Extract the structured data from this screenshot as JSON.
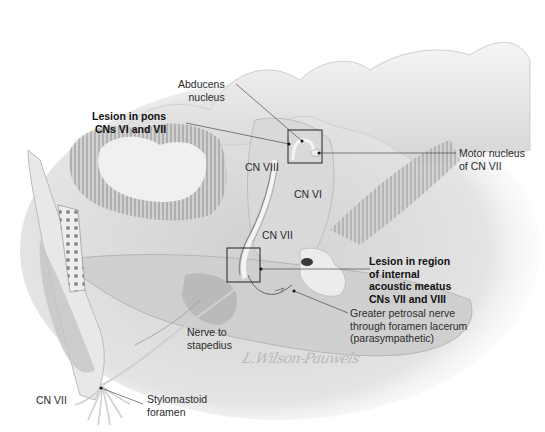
{
  "figure": {
    "style": "grayscale anatomical illustration",
    "signature": "L.Wilson-Pauwels"
  },
  "labels": {
    "abducens_nucleus": [
      "Abducens",
      "nucleus"
    ],
    "lesion_pons": [
      "Lesion in pons",
      "CNs VI and VII"
    ],
    "motor_nucleus": [
      "Motor nucleus",
      "of CN VII"
    ],
    "cn_viii": "CN VIII",
    "cn_vi": "CN VI",
    "cn_vii_upper": "CN VII",
    "lesion_iam": [
      "Lesion in region",
      "of internal",
      "acoustic meatus",
      "CNs VII and VIII"
    ],
    "greater_petrosal": [
      "Greater petrosal nerve",
      "through foramen lacerum",
      "(parasympathetic)"
    ],
    "nerve_to_stapedius": [
      "Nerve to",
      "stapedius"
    ],
    "cn_vii_lower": "CN VII",
    "stylomastoid": [
      "Stylomastoid",
      "foramen"
    ]
  },
  "colors": {
    "background": "#ffffff",
    "tissue_light": "#e6e6e6",
    "tissue_mid": "#c9c9c9",
    "tissue_dark": "#9a9a9a",
    "leader_line": "#333333",
    "text": "#2b2b2b"
  }
}
